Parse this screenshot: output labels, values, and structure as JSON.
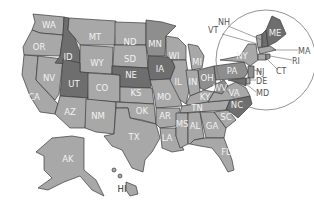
{
  "map": {
    "title": "United States",
    "colors": {
      "light": "#a8a8a8",
      "mid": "#8e8e8e",
      "dark": "#6e6e6e",
      "border": "#3a3a3a",
      "label": "#f2f2f2"
    },
    "states": {
      "WA": "WA",
      "OR": "OR",
      "CA": "CA",
      "NV": "NV",
      "ID": "ID",
      "MT": "MT",
      "WY": "WY",
      "UT": "UT",
      "AZ": "AZ",
      "CO": "CO",
      "NM": "NM",
      "ND": "ND",
      "SD": "SD",
      "NE": "NE",
      "KS": "KS",
      "OK": "OK",
      "TX": "TX",
      "MN": "MN",
      "IA": "IA",
      "MO": "MO",
      "AR": "AR",
      "LA": "LA",
      "WI": "WI",
      "IL": "IL",
      "MI": "MI",
      "IN": "IN",
      "OH": "OH",
      "KY": "KY",
      "TN": "TN",
      "MS": "MS",
      "AL": "AL",
      "GA": "GA",
      "FL": "FL",
      "SC": "SC",
      "NC": "NC",
      "VA": "VA",
      "WV": "WV",
      "PA": "PA",
      "NY": "NY",
      "ME": "ME",
      "AK": "AK",
      "HI": "HI"
    },
    "callouts": {
      "NH": "NH",
      "VT": "VT",
      "MA": "MA",
      "RI": "RI",
      "CT": "CT",
      "NJ": "NJ",
      "DE": "DE",
      "MD": "MD"
    }
  }
}
